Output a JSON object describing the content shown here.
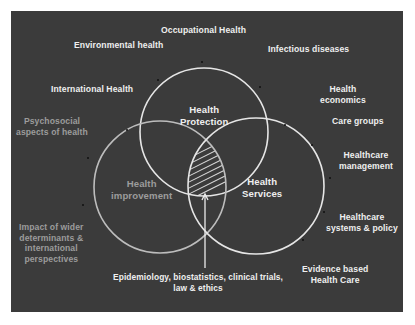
{
  "diagram": {
    "type": "venn",
    "background_color": "#3b3b3b",
    "line_color": "#e6e6e6",
    "circles": [
      {
        "id": "health-protection",
        "label": "Health\nProtection",
        "label_lines": [
          "Health",
          "Protection"
        ],
        "cx": 204,
        "cy": 132,
        "r": 64,
        "text_color": "#efefef"
      },
      {
        "id": "health-improvement",
        "label": "Health\nimprovement",
        "label_lines": [
          "Health",
          "improvement"
        ],
        "cx": 160,
        "cy": 187,
        "r": 66,
        "text_color": "#9c9c9c"
      },
      {
        "id": "health-services",
        "label": "Health\nServices",
        "label_lines": [
          "Health",
          "Services"
        ],
        "cx": 256,
        "cy": 186,
        "r": 68,
        "text_color": "#efefef"
      }
    ],
    "center_annotation": {
      "hatched": true,
      "arrow": "points up into triple intersection",
      "label_lines": [
        "Epidemiology, biostatistics, clinical trials,",
        "law & ethics"
      ]
    },
    "outer_labels": [
      {
        "id": "occupational-health",
        "lines": [
          "Occupational Health"
        ],
        "dim": false
      },
      {
        "id": "environmental-health",
        "lines": [
          "Environmental health"
        ],
        "dim": false
      },
      {
        "id": "infectious-diseases",
        "lines": [
          "Infectious diseases"
        ],
        "dim": false
      },
      {
        "id": "international-health",
        "lines": [
          "International Health"
        ],
        "dim": false
      },
      {
        "id": "health-economics",
        "lines": [
          "Health",
          "economics"
        ],
        "dim": false
      },
      {
        "id": "psychosocial",
        "lines": [
          "Psychosocial",
          "aspects of health"
        ],
        "dim": true
      },
      {
        "id": "care-groups",
        "lines": [
          "Care groups"
        ],
        "dim": false
      },
      {
        "id": "healthcare-management",
        "lines": [
          "Healthcare",
          "management"
        ],
        "dim": false
      },
      {
        "id": "healthcare-systems",
        "lines": [
          "Healthcare",
          "systems & policy"
        ],
        "dim": false
      },
      {
        "id": "impact-wider",
        "lines": [
          "Impact of wider",
          "determinants  &",
          "international",
          "perspectives"
        ],
        "dim": true
      },
      {
        "id": "evidence-based",
        "lines": [
          "Evidence based",
          "Health Care"
        ],
        "dim": false
      }
    ]
  }
}
